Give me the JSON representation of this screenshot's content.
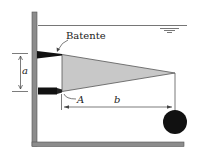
{
  "diagram": {
    "type": "hydrostatics-gate-figure",
    "labels": {
      "stop": "Batente",
      "hinge": "A",
      "dim_a": "a",
      "dim_b": "b"
    },
    "colors": {
      "wall": "#8c8c8c",
      "gate_fill": "#c8c8c8",
      "gate_edge": "#555555",
      "solid": "#111111",
      "water_line": "#666666"
    },
    "elements": [
      {
        "name": "left-wall",
        "desc": "vertical tank wall"
      },
      {
        "name": "floor",
        "desc": "tank bottom"
      },
      {
        "name": "water-surface",
        "desc": "free surface line with level symbol"
      },
      {
        "name": "stop-block",
        "desc": "upper stop (Batente)"
      },
      {
        "name": "hinge-block",
        "desc": "hinge at A"
      },
      {
        "name": "triangular-gate",
        "desc": "gray triangular gate"
      },
      {
        "name": "weight-ball",
        "desc": "black sphere hanging from gate tip"
      }
    ]
  }
}
